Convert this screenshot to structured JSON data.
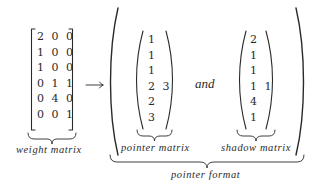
{
  "diagram": {
    "weight_matrix": {
      "label": "weight matrix",
      "bracket": "square",
      "rows": [
        "2 0 0",
        "1 0 0",
        "1 0 0",
        "0 1 1",
        "0 4 0",
        "0 0 1"
      ]
    },
    "arrow": "→",
    "pointer_matrix": {
      "label": "pointer matrix",
      "bracket": "paren",
      "rows": [
        "1",
        "1",
        "1",
        "2 3",
        "2",
        "3"
      ]
    },
    "connector": "and",
    "shadow_matrix": {
      "label": "shadow matrix",
      "bracket": "paren",
      "rows": [
        "2",
        "1",
        "1",
        "1 1",
        "4",
        "1"
      ]
    },
    "group_label": "pointer format",
    "colors": {
      "ink": "#2a2a2a",
      "background": "#ffffff"
    }
  }
}
